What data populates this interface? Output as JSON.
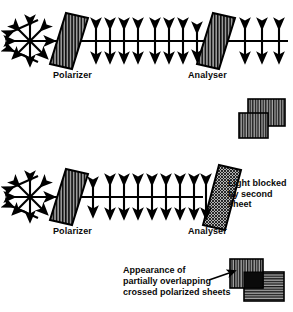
{
  "figure": {
    "type": "physics-optics-diagram",
    "background_color": "#ffffff",
    "ink_color": "#000000",
    "sheet_fill_color": "#8a8a8a"
  },
  "panel_parallel": {
    "name": "parallel-polarizers",
    "description": "Unpolarized light passes polarizer then analyser aligned parallel; light is transmitted",
    "source_label": "unpolarized-light-starburst",
    "polarizer_label": "Polarizer",
    "analyser_label": "Analyser",
    "polarizer_axis": "vertical",
    "analyser_axis": "vertical",
    "beam_before": "unpolarized",
    "beam_between": "vertically-polarized",
    "beam_after": "vertically-polarized",
    "arrow_count_between": 7,
    "arrow_count_after": 3
  },
  "panel_crossed": {
    "name": "crossed-polarizers",
    "description": "Unpolarized light passes polarizer but is stopped by the crossed analyser",
    "source_label": "unpolarized-light-starburst",
    "polarizer_label": "Polarizer",
    "analyser_label": "Analyser",
    "polarizer_axis": "vertical",
    "analyser_axis": "horizontal",
    "beam_before": "unpolarized",
    "beam_between": "vertically-polarized",
    "beam_after": "none",
    "arrow_count_between": 7,
    "blocked_note_lines": [
      "Light blocked",
      "by second",
      "sheet"
    ]
  },
  "inset_parallel": {
    "name": "parallel-sheets-inset",
    "sheet_a_axis": "vertical",
    "sheet_b_axis": "vertical",
    "overlap_appearance": "light-transmitted"
  },
  "inset_crossed": {
    "name": "crossed-sheets-inset",
    "sheet_a_axis": "vertical",
    "sheet_b_axis": "horizontal",
    "overlap_appearance": "black-opaque",
    "caption_lines": [
      "Appearance of",
      "partially  overlapping",
      "crossed polarized sheets"
    ]
  }
}
